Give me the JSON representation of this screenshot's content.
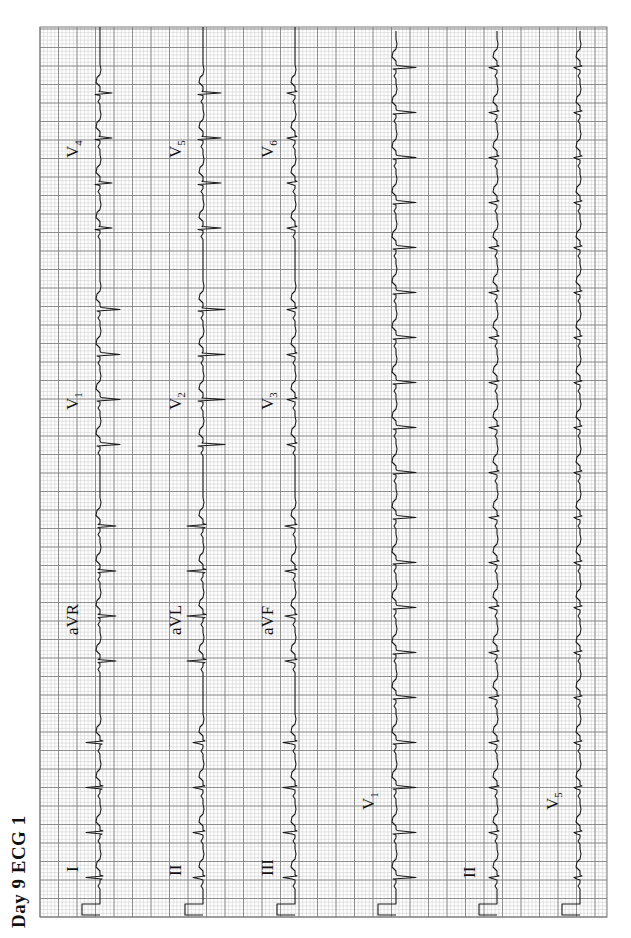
{
  "title": "Day 9 ECG 1",
  "colors": {
    "paper": "#ffffff",
    "minor_grid": "#c8c8c8",
    "major_grid": "#7a7a7a",
    "trace": "#1a1a1a"
  },
  "grid": {
    "x0": 21,
    "y0": 40,
    "x1": 911,
    "y1": 607,
    "minor_px": 3.7,
    "major_px": 18.5
  },
  "chart_data": {
    "type": "ecg",
    "title": "Day 9 ECG 1",
    "layout": "3x4 standard 12-lead + 3 rhythm strips",
    "rows": [
      {
        "baseline": 100,
        "leads": [
          {
            "name": "I",
            "label_main": "I",
            "label_sub": "",
            "x": 48,
            "amp": 14,
            "morph": "upright"
          },
          {
            "name": "aVR",
            "label_main": "aVR",
            "label_sub": "",
            "x": 285,
            "amp": -16,
            "morph": "inverted"
          },
          {
            "name": "V1",
            "label_main": "V",
            "label_sub": "1",
            "x": 510,
            "amp": -20,
            "morph": "qs"
          },
          {
            "name": "V4",
            "label_main": "V",
            "label_sub": "4",
            "x": 762,
            "amp": -12,
            "morph": "rs"
          }
        ]
      },
      {
        "baseline": 203,
        "leads": [
          {
            "name": "II",
            "label_main": "II",
            "label_sub": "",
            "x": 44,
            "amp": -10,
            "morph": "small"
          },
          {
            "name": "aVL",
            "label_main": "aVL",
            "label_sub": "",
            "x": 285,
            "amp": 16,
            "morph": "upright"
          },
          {
            "name": "V2",
            "label_main": "V",
            "label_sub": "2",
            "x": 510,
            "amp": -22,
            "morph": "rs"
          },
          {
            "name": "V5",
            "label_main": "V",
            "label_sub": "5",
            "x": 762,
            "amp": -18,
            "morph": "rs"
          }
        ]
      },
      {
        "baseline": 295,
        "leads": [
          {
            "name": "III",
            "label_main": "III",
            "label_sub": "",
            "x": 44,
            "amp": -12,
            "morph": "small"
          },
          {
            "name": "aVF",
            "label_main": "aVF",
            "label_sub": "",
            "x": 285,
            "amp": -10,
            "morph": "small"
          },
          {
            "name": "V3",
            "label_main": "V",
            "label_sub": "3",
            "x": 510,
            "amp": -8,
            "morph": "small"
          },
          {
            "name": "V6",
            "label_main": "V",
            "label_sub": "6",
            "x": 762,
            "amp": -8,
            "morph": "small"
          }
        ]
      },
      {
        "baseline": 396,
        "leads": [
          {
            "name": "V1",
            "label_main": "V",
            "label_sub": "1",
            "x": 110,
            "amp": -20,
            "morph": "qs",
            "rhythm": true
          }
        ]
      },
      {
        "baseline": 497,
        "leads": [
          {
            "name": "II",
            "label_main": "II",
            "label_sub": "",
            "x": 42,
            "amp": -8,
            "morph": "small",
            "rhythm": true
          }
        ]
      },
      {
        "baseline": 580,
        "leads": [
          {
            "name": "V5",
            "label_main": "V",
            "label_sub": "5",
            "x": 110,
            "amp": -6,
            "morph": "small",
            "rhythm": true
          }
        ]
      }
    ],
    "heart_rate_bpm_approx": 150,
    "rr_interval_px": 45,
    "calibration_pulse": {
      "width_px": 22,
      "height_px": 18
    }
  }
}
